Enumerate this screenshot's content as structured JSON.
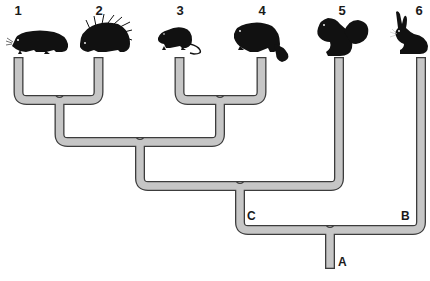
{
  "diagram": {
    "type": "cladogram",
    "colors": {
      "branch_fill": "#c6c6c6",
      "branch_stroke": "#3c3c3c",
      "silhouette": "#111111",
      "label": "#1a1a1a"
    },
    "taxa": [
      {
        "id": "1",
        "label": "1",
        "icon": "mole-icon"
      },
      {
        "id": "2",
        "label": "2",
        "icon": "porcupine-icon"
      },
      {
        "id": "3",
        "label": "3",
        "icon": "rat-icon"
      },
      {
        "id": "4",
        "label": "4",
        "icon": "beaver-icon"
      },
      {
        "id": "5",
        "label": "5",
        "icon": "squirrel-icon"
      },
      {
        "id": "6",
        "label": "6",
        "icon": "rabbit-icon"
      }
    ],
    "nodes": [
      {
        "id": "A",
        "label": "A"
      },
      {
        "id": "B",
        "label": "B"
      },
      {
        "id": "C",
        "label": "C"
      }
    ],
    "topology": "(6,(5,((1,2),(3,4))))"
  }
}
